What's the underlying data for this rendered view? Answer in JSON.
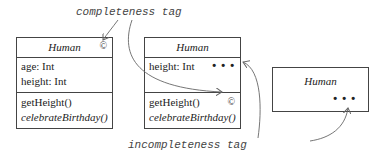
{
  "labels": {
    "completeness": "completeness tag",
    "incompleteness": "incompleteness tag"
  },
  "classes": [
    {
      "name": "Human",
      "attributes": [
        "age: Int",
        "height: Int"
      ],
      "operations": [
        {
          "text": "getHeight()",
          "italic": false
        },
        {
          "text": "celebrateBirthday()",
          "italic": true
        }
      ],
      "name_tag": "©"
    },
    {
      "name": "Human",
      "attributes": [
        "height: Int"
      ],
      "attributes_tag": "• • •",
      "operations": [
        {
          "text": "getHeight()",
          "italic": false
        },
        {
          "text": "celebrateBirthday()",
          "italic": true
        }
      ],
      "operations_tag": "©"
    },
    {
      "name": "Human",
      "body_tag": "• • •"
    }
  ],
  "colors": {
    "stroke": "#444444",
    "text": "#222222",
    "annotation": "#555555"
  }
}
